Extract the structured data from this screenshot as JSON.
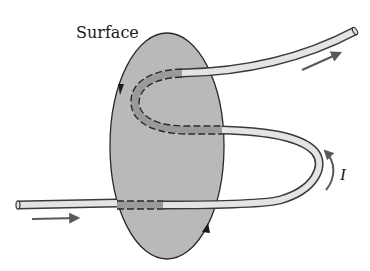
{
  "labels": {
    "surface": "Surface",
    "current": "I"
  },
  "colors": {
    "surface_fill": "#b9b9b9",
    "surface_stroke": "#2a2a2a",
    "wire_fill": "#e4e4e4",
    "wire_inside_fill": "#9a9a9a",
    "wire_stroke": "#3a3a3a",
    "arrow": "#5a5a5a"
  },
  "elements": {
    "surface_shape": "ellipse",
    "wire_crossings_through_surface": 3,
    "current_direction_arrows": [
      "entry-arrow",
      "exit-arrow",
      "loop-current-arrow"
    ],
    "boundary_arrows": [
      "boundary-arrow-left-down",
      "boundary-arrow-right-up"
    ]
  }
}
